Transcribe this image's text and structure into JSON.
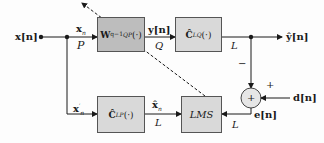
{
  "diagram": {
    "type": "block-diagram",
    "input": {
      "label": "x[n]"
    },
    "blocks": [
      {
        "id": "W",
        "label": "W",
        "sub": "QP",
        "sup": "q−1",
        "arg": "(·)",
        "shaded": "dark"
      },
      {
        "id": "C_LQ",
        "label": "Ĉ",
        "sub": "LQ",
        "sup": "s",
        "arg": "(·)"
      },
      {
        "id": "C_LP",
        "label": "Ĉ",
        "sub": "LP",
        "sup": "s",
        "arg": "(·)"
      },
      {
        "id": "LMS",
        "label": "LMS"
      }
    ],
    "signals": {
      "x_n": {
        "label": "x",
        "sub": "n"
      },
      "x_n_prime": {
        "label": "x",
        "sub": "n",
        "sup": "′"
      },
      "x_hat_n": {
        "label": "x̂",
        "sub": "n"
      },
      "y_n": {
        "label": "y[n]"
      },
      "y_hat_n": {
        "label": "ŷ[n]"
      },
      "d_n": {
        "label": "d[n]"
      },
      "e_n": {
        "label": "e[n]"
      }
    },
    "dimensions": {
      "P": "P",
      "Q": "Q",
      "L_top": "L",
      "L_mid": "L",
      "L_right": "L"
    },
    "summer": {
      "symbol": "+",
      "plus_label": "+",
      "minus_label": "−"
    }
  }
}
